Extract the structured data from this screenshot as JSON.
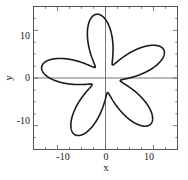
{
  "chart_data": {
    "type": "line",
    "title": "",
    "xlabel": "x",
    "ylabel": "y",
    "xlim": [
      -15.0,
      15.0
    ],
    "ylim": [
      -15.0,
      15.0
    ],
    "xticks": [
      -10,
      0,
      10
    ],
    "yticks": [
      -10,
      0,
      10
    ],
    "xticklabels": [
      "-10",
      "0",
      "10"
    ],
    "yticklabels": [
      "-10",
      "0",
      "10"
    ],
    "minor_ticks": true,
    "grid": false,
    "legend": null,
    "axis_lines_at_origin": true,
    "curve": {
      "name": "five-petal rose trajectory",
      "description": "Closed looping orbit forming five overlapping petals arranged with rotational symmetry about the origin; petal tips reach a radius of about 13.5 units, inner loop crossings occur near a radius of about 3 units.",
      "color": "#1a1a1a",
      "linewidth": 1.6,
      "petal_count": 5,
      "outer_radius": 13.5,
      "inner_radius": 3.1,
      "phase_deg": 8,
      "petal_tip_angles_deg": [
        82,
        154,
        226,
        298,
        10
      ],
      "petal_tips_xy": [
        [
          1.9,
          13.4
        ],
        [
          -12.1,
          5.9
        ],
        [
          -9.4,
          -9.7
        ],
        [
          6.3,
          -11.9
        ],
        [
          13.3,
          2.3
        ]
      ]
    }
  },
  "axes": {
    "frame_color": "#555555",
    "origin_axis_color": "#666666",
    "background": "#ffffff"
  }
}
